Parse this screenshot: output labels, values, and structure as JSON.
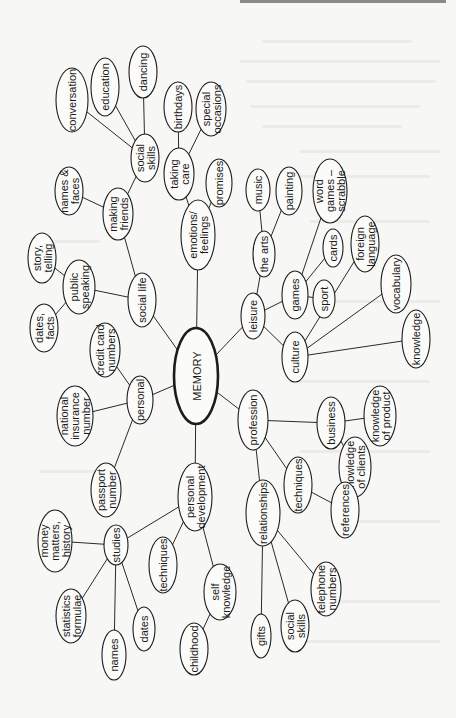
{
  "diagram": {
    "type": "mind-map",
    "orientation": "rotated-90-ccw",
    "root": {
      "id": "memory",
      "label": "MEMORY"
    },
    "nodes": [
      {
        "id": "memory",
        "lines": [
          "MEMORY"
        ],
        "cx": 196,
        "cy": 376,
        "rx": 22,
        "ry": 48,
        "root": true
      },
      {
        "id": "social_life",
        "lines": [
          "social life"
        ],
        "cx": 142,
        "cy": 300,
        "rx": 14,
        "ry": 27
      },
      {
        "id": "making_friends",
        "lines": [
          "making",
          "friends"
        ],
        "cx": 118,
        "cy": 214,
        "rx": 15,
        "ry": 26
      },
      {
        "id": "names_faces",
        "lines": [
          "names &",
          "faces"
        ],
        "cx": 69,
        "cy": 191,
        "rx": 14,
        "ry": 24
      },
      {
        "id": "social_skills_sl",
        "lines": [
          "social",
          "skills"
        ],
        "cx": 145,
        "cy": 158,
        "rx": 14,
        "ry": 24
      },
      {
        "id": "conversation",
        "lines": [
          "conversation"
        ],
        "cx": 72,
        "cy": 100,
        "rx": 16,
        "ry": 32
      },
      {
        "id": "education",
        "lines": [
          "education"
        ],
        "cx": 105,
        "cy": 87,
        "rx": 14,
        "ry": 29
      },
      {
        "id": "dancing",
        "lines": [
          "dancing"
        ],
        "cx": 143,
        "cy": 72,
        "rx": 14,
        "ry": 26
      },
      {
        "id": "public_speaking",
        "lines": [
          "public",
          "speaking"
        ],
        "cx": 79,
        "cy": 287,
        "rx": 16,
        "ry": 27
      },
      {
        "id": "story_telling",
        "lines": [
          "story,",
          "telling"
        ],
        "cx": 42,
        "cy": 258,
        "rx": 14,
        "ry": 25
      },
      {
        "id": "dates_facts",
        "lines": [
          "dates,",
          "facts"
        ],
        "cx": 44,
        "cy": 328,
        "rx": 14,
        "ry": 24
      },
      {
        "id": "emotions",
        "lines": [
          "emotions/",
          "feelings"
        ],
        "cx": 198,
        "cy": 235,
        "rx": 17,
        "ry": 35
      },
      {
        "id": "taking_care",
        "lines": [
          "taking",
          "care"
        ],
        "cx": 179,
        "cy": 174,
        "rx": 15,
        "ry": 26
      },
      {
        "id": "birthdays",
        "lines": [
          "birthdays"
        ],
        "cx": 178,
        "cy": 107,
        "rx": 14,
        "ry": 25
      },
      {
        "id": "special_occasions",
        "lines": [
          "special",
          "occasions"
        ],
        "cx": 211,
        "cy": 109,
        "rx": 15,
        "ry": 27
      },
      {
        "id": "promises",
        "lines": [
          "promises"
        ],
        "cx": 219,
        "cy": 183,
        "rx": 13,
        "ry": 24
      },
      {
        "id": "leisure",
        "lines": [
          "leisure"
        ],
        "cx": 253,
        "cy": 316,
        "rx": 12,
        "ry": 23
      },
      {
        "id": "the_arts",
        "lines": [
          "the arts"
        ],
        "cx": 264,
        "cy": 254,
        "rx": 11,
        "ry": 23
      },
      {
        "id": "music",
        "lines": [
          "music"
        ],
        "cx": 258,
        "cy": 190,
        "rx": 12,
        "ry": 21
      },
      {
        "id": "painting",
        "lines": [
          "painting"
        ],
        "cx": 289,
        "cy": 191,
        "rx": 13,
        "ry": 24
      },
      {
        "id": "games",
        "lines": [
          "games"
        ],
        "cx": 295,
        "cy": 295,
        "rx": 13,
        "ry": 24
      },
      {
        "id": "word_games",
        "lines": [
          "word",
          "games –",
          "scrabble"
        ],
        "cx": 330,
        "cy": 191,
        "rx": 17,
        "ry": 32
      },
      {
        "id": "cards",
        "lines": [
          "cards"
        ],
        "cx": 333,
        "cy": 248,
        "rx": 10,
        "ry": 19
      },
      {
        "id": "sport",
        "lines": [
          "sport"
        ],
        "cx": 324,
        "cy": 299,
        "rx": 11,
        "ry": 19
      },
      {
        "id": "culture",
        "lines": [
          "culture"
        ],
        "cx": 295,
        "cy": 357,
        "rx": 13,
        "ry": 25
      },
      {
        "id": "foreign_language",
        "lines": [
          "foreign",
          "language"
        ],
        "cx": 365,
        "cy": 244,
        "rx": 14,
        "ry": 28
      },
      {
        "id": "vocabulary",
        "lines": [
          "vocabulary"
        ],
        "cx": 396,
        "cy": 284,
        "rx": 15,
        "ry": 29
      },
      {
        "id": "knowledge",
        "lines": [
          "knowledge"
        ],
        "cx": 416,
        "cy": 339,
        "rx": 14,
        "ry": 29
      },
      {
        "id": "profession",
        "lines": [
          "profession"
        ],
        "cx": 253,
        "cy": 420,
        "rx": 15,
        "ry": 30
      },
      {
        "id": "business",
        "lines": [
          "business"
        ],
        "cx": 331,
        "cy": 423,
        "rx": 14,
        "ry": 26
      },
      {
        "id": "knowledge_product",
        "lines": [
          "knowledge",
          "of product"
        ],
        "cx": 380,
        "cy": 416,
        "rx": 16,
        "ry": 30
      },
      {
        "id": "knowledge_clients",
        "lines": [
          "knowledge",
          "of clients"
        ],
        "cx": 355,
        "cy": 467,
        "rx": 16,
        "ry": 30
      },
      {
        "id": "techniques_prof",
        "lines": [
          "techniques"
        ],
        "cx": 298,
        "cy": 485,
        "rx": 14,
        "ry": 28
      },
      {
        "id": "references",
        "lines": [
          "references"
        ],
        "cx": 345,
        "cy": 510,
        "rx": 14,
        "ry": 28
      },
      {
        "id": "relationships",
        "lines": [
          "relationships"
        ],
        "cx": 263,
        "cy": 513,
        "rx": 17,
        "ry": 33
      },
      {
        "id": "telephone_numbers",
        "lines": [
          "telephone",
          "numbers"
        ],
        "cx": 326,
        "cy": 589,
        "rx": 15,
        "ry": 27
      },
      {
        "id": "social_skills_rel",
        "lines": [
          "social",
          "skills"
        ],
        "cx": 295,
        "cy": 626,
        "rx": 14,
        "ry": 26
      },
      {
        "id": "gifts",
        "lines": [
          "gifts"
        ],
        "cx": 261,
        "cy": 636,
        "rx": 10,
        "ry": 22
      },
      {
        "id": "personal",
        "lines": [
          "personal"
        ],
        "cx": 140,
        "cy": 400,
        "rx": 13,
        "ry": 24
      },
      {
        "id": "credit_card",
        "lines": [
          "credit card",
          "numbers"
        ],
        "cx": 105,
        "cy": 350,
        "rx": 15,
        "ry": 27
      },
      {
        "id": "national_insurance",
        "lines": [
          "national",
          "insurance",
          "number"
        ],
        "cx": 75,
        "cy": 416,
        "rx": 18,
        "ry": 30
      },
      {
        "id": "passport",
        "lines": [
          "passport",
          "number"
        ],
        "cx": 106,
        "cy": 490,
        "rx": 15,
        "ry": 27
      },
      {
        "id": "personal_dev",
        "lines": [
          "personal",
          "development"
        ],
        "cx": 195,
        "cy": 497,
        "rx": 17,
        "ry": 34
      },
      {
        "id": "studies",
        "lines": [
          "studies"
        ],
        "cx": 116,
        "cy": 545,
        "rx": 12,
        "ry": 20
      },
      {
        "id": "money_matters",
        "lines": [
          "money",
          "matters,",
          "history"
        ],
        "cx": 55,
        "cy": 541,
        "rx": 17,
        "ry": 31
      },
      {
        "id": "statistics",
        "lines": [
          "statistics",
          "formulae"
        ],
        "cx": 71,
        "cy": 616,
        "rx": 15,
        "ry": 27
      },
      {
        "id": "names",
        "lines": [
          "names"
        ],
        "cx": 114,
        "cy": 655,
        "rx": 12,
        "ry": 25
      },
      {
        "id": "dates",
        "lines": [
          "dates"
        ],
        "cx": 144,
        "cy": 629,
        "rx": 11,
        "ry": 22
      },
      {
        "id": "techniques_pd",
        "lines": [
          "techniques"
        ],
        "cx": 163,
        "cy": 565,
        "rx": 14,
        "ry": 28
      },
      {
        "id": "self_knowledge",
        "lines": [
          "self",
          "knowledge"
        ],
        "cx": 220,
        "cy": 592,
        "rx": 16,
        "ry": 28
      },
      {
        "id": "childhood",
        "lines": [
          "childhood"
        ],
        "cx": 194,
        "cy": 649,
        "rx": 14,
        "ry": 26
      }
    ],
    "edges": [
      [
        "memory",
        "social_life"
      ],
      [
        "memory",
        "emotions"
      ],
      [
        "memory",
        "leisure"
      ],
      [
        "memory",
        "profession"
      ],
      [
        "memory",
        "personal"
      ],
      [
        "memory",
        "personal_dev"
      ],
      [
        "social_life",
        "making_friends"
      ],
      [
        "social_life",
        "public_speaking"
      ],
      [
        "making_friends",
        "names_faces"
      ],
      [
        "making_friends",
        "social_skills_sl"
      ],
      [
        "social_skills_sl",
        "conversation"
      ],
      [
        "social_skills_sl",
        "education"
      ],
      [
        "social_skills_sl",
        "dancing"
      ],
      [
        "public_speaking",
        "story_telling"
      ],
      [
        "public_speaking",
        "dates_facts"
      ],
      [
        "emotions",
        "taking_care"
      ],
      [
        "emotions",
        "promises"
      ],
      [
        "taking_care",
        "birthdays"
      ],
      [
        "taking_care",
        "special_occasions"
      ],
      [
        "leisure",
        "the_arts"
      ],
      [
        "leisure",
        "games"
      ],
      [
        "leisure",
        "culture"
      ],
      [
        "the_arts",
        "music"
      ],
      [
        "the_arts",
        "painting"
      ],
      [
        "games",
        "word_games"
      ],
      [
        "games",
        "cards"
      ],
      [
        "games",
        "sport"
      ],
      [
        "culture",
        "foreign_language"
      ],
      [
        "culture",
        "vocabulary"
      ],
      [
        "culture",
        "knowledge"
      ],
      [
        "profession",
        "business"
      ],
      [
        "profession",
        "techniques_prof"
      ],
      [
        "profession",
        "relationships"
      ],
      [
        "business",
        "knowledge_product"
      ],
      [
        "business",
        "knowledge_clients"
      ],
      [
        "techniques_prof",
        "references"
      ],
      [
        "relationships",
        "telephone_numbers"
      ],
      [
        "relationships",
        "social_skills_rel"
      ],
      [
        "relationships",
        "gifts"
      ],
      [
        "personal",
        "credit_card"
      ],
      [
        "personal",
        "national_insurance"
      ],
      [
        "personal",
        "passport"
      ],
      [
        "personal_dev",
        "studies"
      ],
      [
        "personal_dev",
        "techniques_pd"
      ],
      [
        "personal_dev",
        "self_knowledge"
      ],
      [
        "studies",
        "money_matters"
      ],
      [
        "studies",
        "statistics"
      ],
      [
        "studies",
        "names"
      ],
      [
        "studies",
        "dates"
      ],
      [
        "self_knowledge",
        "childhood"
      ]
    ]
  },
  "colors": {
    "paper": "#f7f7f5",
    "ink": "#1c1c1c",
    "show_through": "#ebebe8",
    "top_edge": "#8a8a8a"
  }
}
